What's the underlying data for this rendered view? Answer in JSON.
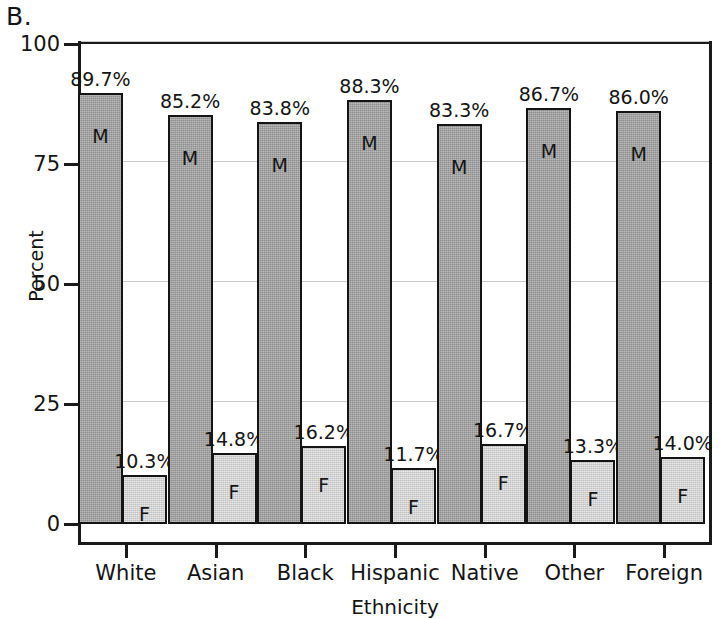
{
  "panel": {
    "label": "B."
  },
  "chart_data": {
    "type": "bar",
    "title": "",
    "xlabel": "Ethnicity",
    "ylabel": "Percent",
    "ylim": [
      0,
      100
    ],
    "yticks": [
      0,
      25,
      50,
      75,
      100
    ],
    "ytick_labels": [
      "0",
      "25",
      "50",
      "75",
      "100"
    ],
    "grid": true,
    "legend": "none",
    "categories": [
      "White",
      "Asian",
      "Black",
      "Hispanic",
      "Native",
      "Other",
      "Foreign"
    ],
    "series": [
      {
        "name": "M",
        "letter": "M",
        "color": "#9c9c9c",
        "values": [
          89.7,
          85.2,
          83.8,
          88.3,
          83.3,
          86.7,
          86.0
        ],
        "labels": [
          "89.7%",
          "85.2%",
          "83.8%",
          "88.3%",
          "83.3%",
          "86.7%",
          "86.0%"
        ]
      },
      {
        "name": "F",
        "letter": "F",
        "color": "#cfcfcf",
        "values": [
          10.3,
          14.8,
          16.2,
          11.7,
          16.7,
          13.3,
          14.0
        ],
        "labels": [
          "10.3%",
          "14.8%",
          "16.2%",
          "11.7%",
          "16.7%",
          "13.3%",
          "14.0%"
        ]
      }
    ]
  }
}
